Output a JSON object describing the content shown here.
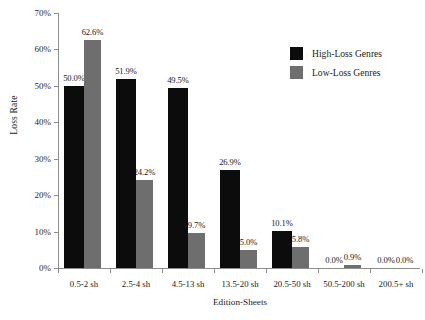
{
  "chart_data": {
    "type": "bar",
    "title": "",
    "xlabel": "Edition-Sheets",
    "ylabel": "Loss Rate",
    "categories": [
      "0.5-2 sh",
      "2.5-4 sh",
      "4.5-13 sh",
      "13.5-20 sh",
      "20.5-50 sh",
      "50.5-200 sh",
      "200.5+ sh"
    ],
    "series": [
      {
        "name": "High-Loss Genres",
        "color": "#0c0c0c",
        "values": [
          50.0,
          51.9,
          49.5,
          26.9,
          10.1,
          0.0,
          0.0
        ],
        "labels": [
          "50.0%",
          "51.9%",
          "49.5%",
          "26.9%",
          "10.1%",
          "0.0%",
          "0.0%"
        ]
      },
      {
        "name": "Low-Loss Genres",
        "color": "#6e6e6e",
        "values": [
          62.6,
          24.2,
          9.7,
          5.0,
          5.8,
          0.9,
          0.0
        ],
        "labels": [
          "62.6%",
          "24.2%",
          "9.7%",
          "5.0%",
          "5.8%",
          "0.9%",
          "0.0%"
        ]
      }
    ],
    "ylim": [
      0,
      70
    ],
    "ytick_values": [
      0,
      10,
      20,
      30,
      40,
      50,
      60,
      70
    ],
    "ytick_labels": [
      "0%",
      "10%",
      "20%",
      "30%",
      "40%",
      "50%",
      "60%",
      "70%"
    ],
    "grid": false,
    "legend_position": "top-right",
    "value_labels_shown": true
  }
}
